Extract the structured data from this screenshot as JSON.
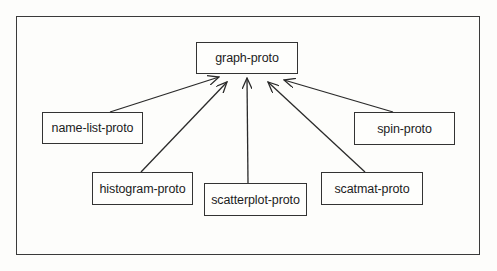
{
  "diagram": {
    "type": "inheritance-tree",
    "root": {
      "id": "graph",
      "label": "graph-proto"
    },
    "nodes": [
      {
        "id": "graph",
        "label": "graph-proto",
        "x": 196,
        "y": 42,
        "w": 102,
        "h": 32
      },
      {
        "id": "namelist",
        "label": "name-list-proto",
        "x": 42,
        "y": 112,
        "w": 101,
        "h": 32
      },
      {
        "id": "spin",
        "label": "spin-proto",
        "x": 354,
        "y": 112,
        "w": 101,
        "h": 33
      },
      {
        "id": "histogram",
        "label": "histogram-proto",
        "x": 92,
        "y": 172,
        "w": 101,
        "h": 33
      },
      {
        "id": "scatterplot",
        "label": "scatterplot-proto",
        "x": 204,
        "y": 183,
        "w": 103,
        "h": 33
      },
      {
        "id": "scatmat",
        "label": "scatmat-proto",
        "x": 321,
        "y": 172,
        "w": 102,
        "h": 33
      }
    ],
    "edges": [
      {
        "from": "namelist",
        "to": "graph",
        "x1": 110,
        "y1": 112,
        "x2": 219,
        "y2": 77
      },
      {
        "from": "histogram",
        "to": "graph",
        "x1": 141,
        "y1": 172,
        "x2": 227,
        "y2": 82
      },
      {
        "from": "scatterplot",
        "to": "graph",
        "x1": 248,
        "y1": 183,
        "x2": 247,
        "y2": 78
      },
      {
        "from": "scatmat",
        "to": "graph",
        "x1": 365,
        "y1": 172,
        "x2": 268,
        "y2": 82
      },
      {
        "from": "spin",
        "to": "graph",
        "x1": 393,
        "y1": 112,
        "x2": 284,
        "y2": 80
      }
    ]
  },
  "labels": {
    "graph": "graph-proto",
    "namelist": "name-list-proto",
    "spin": "spin-proto",
    "histogram": "histogram-proto",
    "scatterplot": "scatterplot-proto",
    "scatmat": "scatmat-proto"
  },
  "colors": {
    "line": "#2a2a2a",
    "background": "#fdfdfb"
  }
}
